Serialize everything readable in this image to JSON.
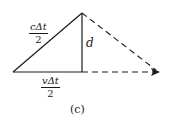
{
  "diagram": {
    "caption": "(c)",
    "labels": {
      "hypotenuse": {
        "numerator": "cΔt",
        "denominator": "2"
      },
      "base": {
        "numerator": "vΔt",
        "denominator": "2"
      },
      "height": "d"
    },
    "colors": {
      "line": "#1a1a1a",
      "background": "#ffffff"
    },
    "geometry": {
      "left_vertex": [
        13,
        72
      ],
      "apex": [
        82,
        13
      ],
      "foot": [
        82,
        72
      ],
      "right_end": [
        160,
        72
      ]
    }
  }
}
